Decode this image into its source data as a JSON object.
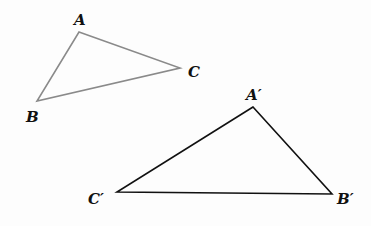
{
  "diagram": {
    "triangle1": {
      "stroke": "#8a8a8a",
      "vertices": {
        "A": {
          "label": "A",
          "x": 79,
          "y": 32,
          "lx": 74,
          "ly": 25
        },
        "B": {
          "label": "B",
          "x": 37,
          "y": 101,
          "lx": 26,
          "ly": 122
        },
        "C": {
          "label": "C",
          "x": 180,
          "y": 68,
          "lx": 188,
          "ly": 77
        }
      }
    },
    "triangle2": {
      "stroke": "#111111",
      "vertices": {
        "A": {
          "label": "A′",
          "x": 253,
          "y": 107,
          "lx": 246,
          "ly": 100
        },
        "B": {
          "label": "B′",
          "x": 332,
          "y": 194,
          "lx": 337,
          "ly": 204
        },
        "C": {
          "label": "C′",
          "x": 117,
          "y": 192,
          "lx": 88,
          "ly": 204
        }
      }
    }
  }
}
